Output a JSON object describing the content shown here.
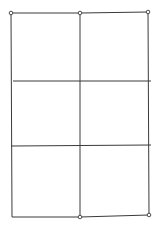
{
  "diagram": {
    "type": "grid",
    "columns": 2,
    "rows": 3,
    "colors": {
      "line": "#3a3a3a",
      "node_fill": "#ffffff",
      "background": "#ffffff"
    },
    "edges": [
      {
        "id": "top-left-half",
        "x1": 11,
        "y1": 13,
        "x2": 80,
        "y2": 13
      },
      {
        "id": "top-right-half",
        "x1": 80,
        "y1": 13,
        "x2": 148,
        "y2": 12
      },
      {
        "id": "left-side",
        "x1": 11,
        "y1": 13,
        "x2": 12,
        "y2": 217
      },
      {
        "id": "middle-vertical",
        "x1": 80,
        "y1": 13,
        "x2": 80,
        "y2": 217
      },
      {
        "id": "right-side",
        "x1": 148,
        "y1": 12,
        "x2": 149,
        "y2": 215
      },
      {
        "id": "row-divider-1",
        "x1": 13,
        "y1": 81,
        "x2": 151,
        "y2": 81
      },
      {
        "id": "row-divider-2",
        "x1": 11,
        "y1": 146,
        "x2": 151,
        "y2": 145
      },
      {
        "id": "bottom-left-half",
        "x1": 12,
        "y1": 217,
        "x2": 80,
        "y2": 217
      },
      {
        "id": "bottom-right-half",
        "x1": 80,
        "y1": 217,
        "x2": 149,
        "y2": 215
      }
    ],
    "nodes": [
      {
        "id": "node-top-left",
        "cx": 11,
        "cy": 13,
        "r": 1.8
      },
      {
        "id": "node-top-middle",
        "cx": 80,
        "cy": 13,
        "r": 1.8
      },
      {
        "id": "node-top-right",
        "cx": 148,
        "cy": 12,
        "r": 1.8
      },
      {
        "id": "node-bottom-middle",
        "cx": 80,
        "cy": 217,
        "r": 1.8
      },
      {
        "id": "node-bottom-right",
        "cx": 149,
        "cy": 215,
        "r": 1.8
      }
    ]
  }
}
